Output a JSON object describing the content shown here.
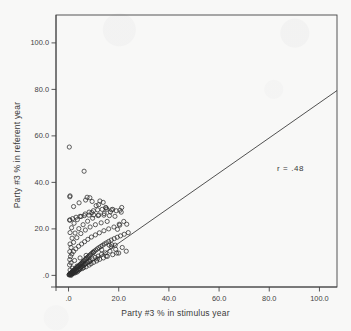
{
  "figure": {
    "background_color": "#f8f8f7",
    "ink_color": "#444444",
    "marker_color": "#2b2b2b"
  },
  "annotation": {
    "correlation_label": "r = .48"
  },
  "chart_data": {
    "type": "scatter",
    "title": "",
    "xlabel": "Party #3 % in stimulus year",
    "ylabel": "Party #3 % in referent year",
    "xlim": [
      -5,
      107
    ],
    "ylim": [
      -5,
      112
    ],
    "xticks": [
      0,
      20,
      40,
      60,
      80,
      100
    ],
    "xticklabels": [
      ".0",
      "20.0",
      "40.0",
      "60.0",
      "80.0",
      "100.0"
    ],
    "yticks": [
      0,
      20,
      40,
      60,
      80,
      100
    ],
    "yticklabels": [
      ".0",
      "20.0",
      "60.0",
      "80.0",
      "100.0"
    ],
    "ytick_labels": [
      ".0",
      "20.0",
      "40.0",
      "60.0",
      "80.0",
      "100.0"
    ],
    "grid": false,
    "legend": false,
    "marker_style": "open-circle",
    "marker_size_px": 4.2,
    "annotations": [
      {
        "text": "r = .48",
        "x": 79,
        "y": 43
      }
    ],
    "fit_line": {
      "type": "linear",
      "slope": 0.755,
      "intercept": -1.2,
      "x_start": 1.6,
      "y_start": 0.0,
      "x_end": 107,
      "y_end": 79.5
    },
    "series": [
      {
        "name": "observations",
        "x": [
          0.2,
          0.3,
          0.4,
          0.6,
          0.7,
          0.8,
          0.9,
          1.0,
          1.1,
          1.2,
          1.3,
          1.4,
          1.5,
          1.6,
          1.7,
          1.8,
          1.9,
          2.0,
          2.1,
          2.2,
          2.3,
          2.4,
          2.5,
          2.6,
          2.8,
          2.9,
          3.0,
          3.1,
          3.2,
          3.4,
          3.5,
          3.6,
          3.8,
          3.9,
          4.0,
          4.1,
          4.3,
          4.4,
          4.5,
          4.7,
          4.8,
          5.0,
          5.1,
          5.3,
          5.4,
          5.6,
          5.8,
          5.9,
          6.0,
          6.2,
          6.4,
          6.5,
          6.7,
          6.9,
          7.0,
          7.2,
          7.4,
          7.6,
          7.8,
          8.0,
          8.2,
          8.4,
          8.6,
          8.8,
          9.0,
          9.3,
          9.5,
          9.8,
          10.0,
          10.3,
          10.6,
          10.9,
          11.2,
          11.5,
          11.8,
          12.1,
          12.4,
          12.8,
          13.1,
          13.5,
          13.9,
          14.3,
          14.7,
          15.1,
          15.5,
          16.0,
          16.5,
          17.0,
          17.6,
          18.2,
          18.8,
          19.4,
          20.0,
          20.7,
          21.4,
          22.2,
          23.0,
          23.8,
          0.4,
          0.5,
          0.6,
          0.8,
          1.0,
          1.3,
          1.6,
          2.0,
          2.4,
          2.9,
          3.4,
          4.0,
          4.6,
          5.2,
          5.8,
          6.4,
          7.0,
          7.7,
          8.4,
          9.1,
          9.9,
          10.7,
          11.5,
          12.3,
          13.2,
          14.1,
          15.0,
          16.0,
          17.0,
          18.1,
          19.2,
          20.4,
          0.5,
          0.6,
          1.0,
          1.4,
          2.0,
          2.6,
          3.3,
          4.1,
          4.9,
          5.8,
          6.7,
          7.6,
          8.6,
          9.6,
          10.7,
          11.8,
          13.0,
          14.2,
          15.4,
          16.7,
          0.6,
          1.2,
          2.2,
          3.5,
          5.0,
          6.6,
          8.2,
          9.9,
          11.6,
          13.4,
          15.2,
          17.1,
          19.0,
          21.0,
          0.4,
          1.6,
          3.0,
          4.6,
          6.3,
          8.1,
          10.0,
          12.0,
          14.1,
          16.3,
          18.5,
          0.5,
          2.0,
          4.2,
          6.8,
          9.4,
          12.0,
          14.8,
          17.6,
          20.5,
          0.3,
          0.6,
          0.6,
          1.0,
          6.2,
          7.4,
          8.5,
          9.3,
          11.0,
          12.5,
          13.8,
          15.0,
          16.2,
          17.2,
          18.6,
          19.5,
          20.2,
          21.2,
          22.0,
          23.2
        ],
        "y": [
          0.2,
          0.4,
          0.3,
          0.6,
          0.5,
          0.9,
          0.4,
          1.0,
          0.7,
          1.2,
          0.5,
          1.4,
          0.9,
          1.6,
          0.8,
          1.8,
          1.1,
          2.0,
          1.3,
          2.2,
          1.0,
          2.4,
          1.6,
          2.7,
          1.2,
          2.9,
          1.9,
          3.1,
          2.2,
          3.4,
          1.5,
          3.6,
          2.6,
          3.9,
          2.1,
          4.1,
          3.0,
          4.4,
          2.5,
          4.7,
          3.4,
          5.0,
          3.8,
          5.3,
          2.9,
          5.6,
          4.2,
          6.0,
          3.3,
          6.3,
          4.7,
          6.7,
          5.1,
          7.0,
          3.7,
          7.4,
          5.6,
          7.8,
          6.1,
          8.2,
          4.4,
          8.6,
          6.6,
          9.0,
          5.0,
          9.5,
          7.1,
          10.0,
          5.6,
          10.4,
          7.7,
          10.9,
          6.2,
          11.4,
          8.3,
          11.9,
          6.9,
          12.4,
          9.0,
          12.9,
          7.5,
          13.5,
          9.7,
          14.0,
          8.2,
          14.6,
          10.4,
          15.2,
          8.9,
          15.8,
          11.2,
          16.4,
          9.6,
          17.0,
          12.0,
          17.7,
          10.4,
          18.4,
          4.5,
          6.8,
          2.3,
          8.1,
          5.4,
          9.2,
          3.1,
          10.3,
          6.4,
          11.4,
          4.0,
          12.5,
          7.5,
          13.5,
          5.0,
          14.5,
          8.6,
          15.5,
          6.0,
          16.5,
          9.8,
          17.4,
          7.1,
          18.3,
          11.0,
          19.2,
          8.3,
          20.0,
          12.3,
          20.8,
          9.6,
          21.6,
          10.2,
          13.5,
          12.0,
          16.0,
          14.2,
          18.2,
          16.2,
          20.1,
          18.0,
          21.8,
          19.5,
          23.3,
          20.8,
          24.6,
          21.8,
          25.7,
          22.6,
          26.6,
          23.2,
          27.3,
          18.4,
          20.5,
          22.4,
          24.0,
          25.3,
          26.4,
          27.2,
          27.8,
          28.2,
          28.4,
          28.4,
          28.2,
          27.8,
          27.2,
          23.8,
          24.4,
          25.0,
          25.4,
          25.7,
          25.9,
          26.0,
          26.0,
          25.9,
          25.7,
          25.4,
          33.8,
          29.6,
          31.2,
          32.4,
          31.8,
          30.4,
          29.2,
          28.4,
          28.0,
          55.2,
          34.2,
          23.8,
          0.0,
          44.8,
          33.6,
          33.4,
          27.0,
          30.0,
          32.0,
          31.4,
          29.0,
          13.0,
          13.2,
          13.0,
          19.8,
          22.0,
          29.2,
          23.2,
          22.0
        ]
      }
    ]
  }
}
